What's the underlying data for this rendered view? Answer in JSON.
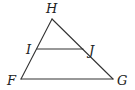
{
  "diagram": {
    "type": "triangle-with-midsegment",
    "stroke_color": "#333333",
    "label_color": "#222222",
    "background": "#ffffff",
    "points": {
      "H": {
        "x": 52,
        "y": 19
      },
      "F": {
        "x": 21,
        "y": 79
      },
      "G": {
        "x": 113,
        "y": 79
      },
      "I": {
        "x": 37,
        "y": 49
      },
      "J": {
        "x": 83,
        "y": 49
      }
    },
    "labels": {
      "H": {
        "text": "H",
        "x": 46,
        "y": 13
      },
      "I": {
        "text": "I",
        "x": 26,
        "y": 54
      },
      "J": {
        "text": "J",
        "x": 89,
        "y": 55
      },
      "F": {
        "text": "F",
        "x": 7,
        "y": 85
      },
      "G": {
        "text": "G",
        "x": 117,
        "y": 85
      }
    },
    "segments": [
      {
        "name": "HF",
        "from": "H",
        "to": "F"
      },
      {
        "name": "HG",
        "from": "H",
        "to": "G"
      },
      {
        "name": "FG",
        "from": "F",
        "to": "G"
      },
      {
        "name": "IJ",
        "from": "I",
        "to": "J"
      }
    ]
  }
}
